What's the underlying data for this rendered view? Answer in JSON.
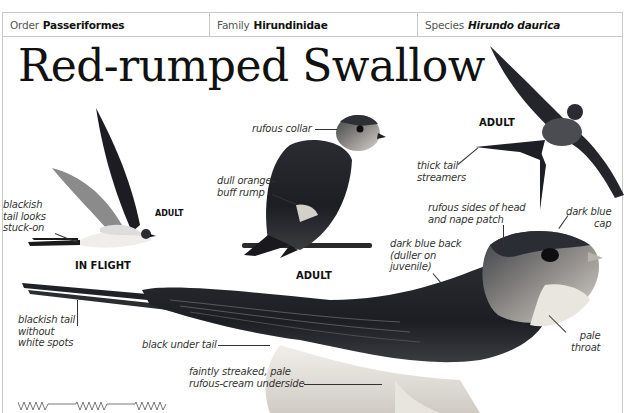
{
  "taxonomy": {
    "order_label": "Order",
    "order_value": "Passeriformes",
    "family_label": "Family",
    "family_value": "Hirundinidae",
    "species_label": "Species",
    "species_value": "Hirundo daurica"
  },
  "title": "Red-rumped Swallow",
  "illustrations": {
    "in_flight": {
      "caption": "IN FLIGHT",
      "sub_caption": "ADULT",
      "annotations": [
        "blackish",
        "tail looks",
        "stuck-on"
      ]
    },
    "perched_adult": {
      "caption": "ADULT",
      "annotations": {
        "collar": "rufous collar",
        "rump_1": "dull orange-",
        "rump_2": "buff rump"
      }
    },
    "flying_adult": {
      "caption": "ADULT",
      "annotations": {
        "streamers_1": "thick tail",
        "streamers_2": "streamers"
      }
    },
    "main_photo": {
      "annotations": {
        "head_1": "rufous sides of head",
        "head_2": "and nape patch",
        "cap_1": "dark blue",
        "cap_2": "cap",
        "back_1": "dark blue back",
        "back_2": "(duller on",
        "back_3": "juvenile)",
        "tail_1": "blackish tail",
        "tail_2": "without",
        "tail_3": "white spots",
        "under_tail": "black under tail",
        "underside_1": "faintly streaked, pale",
        "underside_2": "rufous-cream underside",
        "throat_1": "pale",
        "throat_2": "throat"
      }
    }
  },
  "colors": {
    "border": "#c8c8c8",
    "text_dark": "#111111",
    "label_text": "#333333",
    "bird_dark": "#1c1e24",
    "bird_mid": "#55585e",
    "bird_light": "#e8e6e2"
  }
}
